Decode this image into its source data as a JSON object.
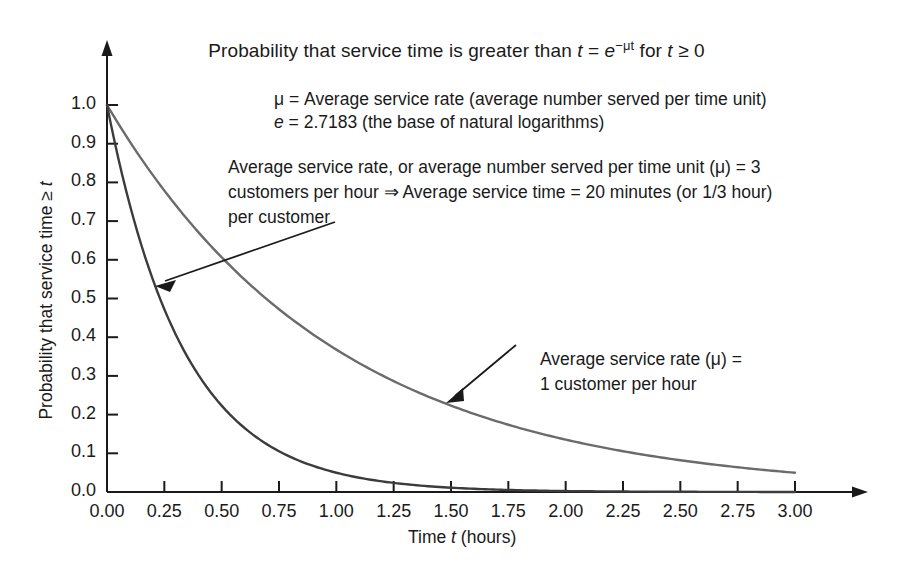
{
  "chart_data": {
    "type": "line",
    "title_parts": {
      "lead": "Probability that service time is greater than ",
      "var_t": "t",
      "equals": " = ",
      "base": "e",
      "exponent": "−μt",
      "tail": " for ",
      "var_t2": "t",
      "tail2": " ≥ 0"
    },
    "xlabel": "Time t (hours)",
    "xlabel_parts": {
      "pre": "Time ",
      "var": "t",
      "post": " (hours)"
    },
    "ylabel": "Probability that service time ≥ t",
    "ylabel_parts": {
      "pre": "Probability that service time ≥ ",
      "var": "t"
    },
    "xlim": [
      0,
      3
    ],
    "ylim": [
      0,
      1
    ],
    "xticks": [
      "0.00",
      "0.25",
      "0.50",
      "0.75",
      "1.00",
      "1.25",
      "1.50",
      "1.75",
      "2.00",
      "2.25",
      "2.50",
      "2.75",
      "3.00"
    ],
    "yticks": [
      "0.0",
      "0.1",
      "0.2",
      "0.3",
      "0.4",
      "0.5",
      "0.6",
      "0.7",
      "0.8",
      "0.9",
      "1.0"
    ],
    "grid": false,
    "legend_position": "annotations",
    "axis_arrows": true,
    "series": [
      {
        "name": "Average service rate (μ) = 3 customers per hour",
        "mu": 3,
        "color": "#3c3c3c",
        "x": [
          0,
          0.25,
          0.5,
          0.75,
          1.0,
          1.25,
          1.5,
          1.75,
          2.0,
          2.25,
          2.5,
          2.75,
          3.0
        ],
        "values": [
          1.0,
          0.472,
          0.223,
          0.105,
          0.0498,
          0.0235,
          0.0111,
          0.00525,
          0.00248,
          0.00117,
          0.00055,
          0.00026,
          0.00012
        ]
      },
      {
        "name": "Average service rate (μ) = 1 customer per hour",
        "mu": 1,
        "color": "#6b6b6b",
        "x": [
          0,
          0.25,
          0.5,
          0.75,
          1.0,
          1.25,
          1.5,
          1.75,
          2.0,
          2.25,
          2.5,
          2.75,
          3.0
        ],
        "values": [
          1.0,
          0.779,
          0.607,
          0.472,
          0.368,
          0.287,
          0.223,
          0.174,
          0.135,
          0.105,
          0.082,
          0.064,
          0.0498
        ]
      }
    ],
    "annotations": [
      {
        "id": "definitions",
        "lines": [
          "μ = Average service rate (average number served per time unit)",
          "e = 2.7183 (the base of natural logarithms)"
        ]
      },
      {
        "id": "mu3-note",
        "lines": [
          "Average service rate, or average number served per time unit (μ) = 3",
          "customers per hour ⇒ Average service time = 20 minutes (or 1/3 hour)",
          "per customer"
        ],
        "points_to_series": "mu3"
      },
      {
        "id": "mu1-note",
        "lines": [
          "Average service rate (μ) =",
          "1 customer per hour"
        ],
        "points_to_series": "mu1"
      }
    ]
  },
  "defs": {
    "mu_line_pre": "μ = Average service rate (average number served per time unit)",
    "e_line_var": "e",
    "e_line_rest": " = 2.7183 (the base of natural logarithms)"
  },
  "note": {
    "line1": "Average service rate, or average number served per time unit (μ) = 3",
    "line2": "customers per hour ⇒ Average service time = 20 minutes (or 1/3 hour)",
    "line3": "per customer"
  },
  "mu1_note": {
    "line1": "Average service rate (μ) =",
    "line2": "1 customer per hour"
  }
}
